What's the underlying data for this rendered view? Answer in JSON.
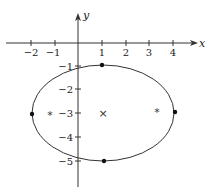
{
  "diagram": {
    "type": "ellipse-plot",
    "axes": {
      "x_label": "x",
      "y_label": "y",
      "x_ticks": [
        {
          "value": -2,
          "label": "−2"
        },
        {
          "value": -1,
          "label": "−1"
        },
        {
          "value": 1,
          "label": "1"
        },
        {
          "value": 2,
          "label": "2"
        },
        {
          "value": 3,
          "label": "3"
        },
        {
          "value": 4,
          "label": "4"
        }
      ],
      "y_ticks": [
        {
          "value": -1,
          "label": "−1"
        },
        {
          "value": -2,
          "label": "−2"
        },
        {
          "value": -3,
          "label": "−3"
        },
        {
          "value": -4,
          "label": "−4"
        },
        {
          "value": -5,
          "label": "−5"
        }
      ]
    },
    "ellipse": {
      "center": [
        1,
        -3
      ],
      "semi_major_horizontal": 3,
      "semi_minor_vertical": 2,
      "stroke_color": "#333333"
    },
    "vertices": [
      {
        "name": "left-vertex",
        "x": -2,
        "y": -3
      },
      {
        "name": "right-vertex",
        "x": 4,
        "y": -3
      },
      {
        "name": "top-vertex",
        "x": 1,
        "y": -1
      },
      {
        "name": "bottom-vertex",
        "x": 1,
        "y": -5
      }
    ],
    "foci": [
      {
        "name": "left-focus",
        "x": -1.24,
        "y": -3,
        "symbol": "*"
      },
      {
        "name": "right-focus",
        "x": 3.24,
        "y": -3,
        "symbol": "*"
      }
    ],
    "center_marker": {
      "x": 1,
      "y": -3,
      "symbol": "×"
    }
  }
}
